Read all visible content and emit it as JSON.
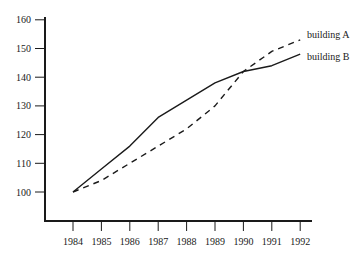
{
  "chart_data": {
    "type": "line",
    "title": "",
    "xlabel": "",
    "ylabel": "",
    "x": [
      "1984",
      "1985",
      "1986",
      "1987",
      "1988",
      "1989",
      "1990",
      "1991",
      "1992"
    ],
    "yticks": [
      100,
      110,
      120,
      130,
      140,
      150,
      160
    ],
    "ylim": [
      90,
      160
    ],
    "grid": false,
    "legend_position": "inline-right",
    "series": [
      {
        "name": "building A",
        "style": "dashed",
        "values": [
          100,
          104,
          110,
          116,
          122,
          130,
          142,
          149,
          153
        ]
      },
      {
        "name": "building B",
        "style": "solid",
        "values": [
          100,
          108,
          116,
          126,
          132,
          138,
          142,
          144,
          148
        ]
      }
    ]
  },
  "colors": {
    "axis": "#1a1a1a",
    "line": "#1a1a1a",
    "background": "#ffffff"
  }
}
